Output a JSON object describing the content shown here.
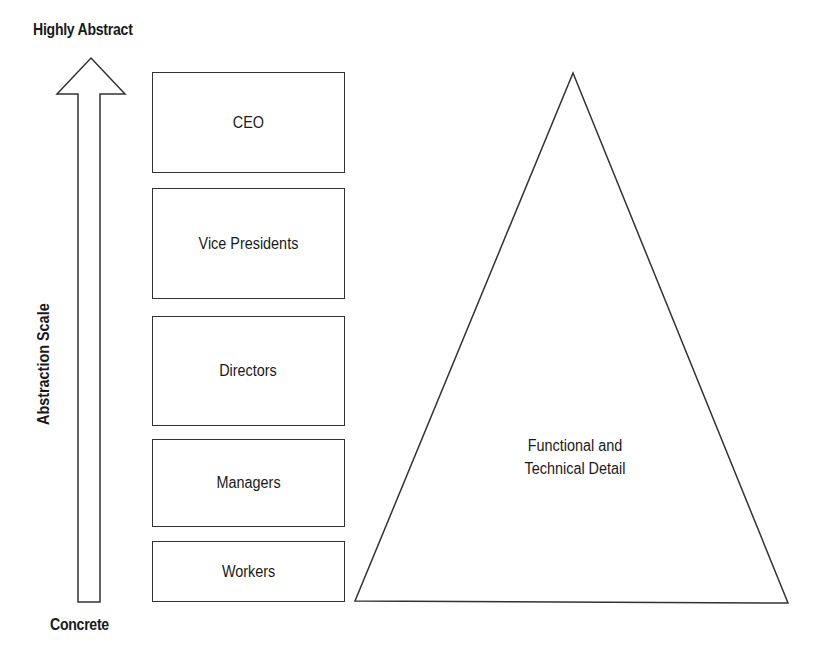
{
  "axis": {
    "top_label": "Highly Abstract",
    "bottom_label": "Concrete",
    "scale_label": "Abstraction Scale"
  },
  "hierarchy": {
    "levels": [
      {
        "label": "CEO"
      },
      {
        "label": "Vice Presidents"
      },
      {
        "label": "Directors"
      },
      {
        "label": "Managers"
      },
      {
        "label": "Workers"
      }
    ]
  },
  "pyramid": {
    "line1": "Functional and",
    "line2": "Technical Detail"
  }
}
